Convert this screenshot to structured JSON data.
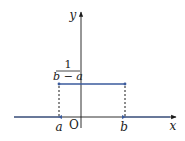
{
  "diagram": {
    "type": "uniform-distribution-pdf",
    "axes": {
      "x_label": "x",
      "y_label": "y",
      "origin_label": "O"
    },
    "points": {
      "a_label": "a",
      "b_label": "b"
    },
    "height_label": {
      "numerator": "1",
      "denominator": "b − a"
    },
    "colors": {
      "axis": "#1a1a1a",
      "density_line": "#3a5a9c",
      "dashed": "#1a1a1a"
    }
  }
}
